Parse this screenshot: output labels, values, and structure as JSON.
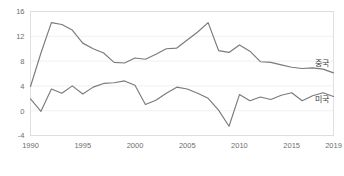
{
  "chart_data": {
    "type": "line",
    "title": "",
    "subtitle": "",
    "xlabel": "",
    "ylabel": "",
    "xlim": [
      1990,
      2019
    ],
    "ylim": [
      -4,
      16
    ],
    "yticks": [
      16,
      12,
      8,
      4,
      0,
      -4
    ],
    "ytick_labels": [
      "16",
      "12",
      "8",
      "4",
      "0",
      "-4"
    ],
    "xticks": [
      1990,
      1995,
      2000,
      2005,
      2010,
      2015,
      2019
    ],
    "xtick_labels": [
      "1990",
      "1995",
      "2000",
      "2005",
      "2010",
      "2015",
      "2019"
    ],
    "grid": true,
    "grid_axis": "y",
    "legend_position": "inline-right",
    "x": [
      1990,
      1991,
      1992,
      1993,
      1994,
      1995,
      1996,
      1997,
      1998,
      1999,
      2000,
      2001,
      2002,
      2003,
      2004,
      2005,
      2006,
      2007,
      2008,
      2009,
      2010,
      2011,
      2012,
      2013,
      2014,
      2015,
      2016,
      2017,
      2018,
      2019
    ],
    "series": [
      {
        "name": "중국",
        "label": "중국",
        "color": "#7a7a7a",
        "label_x": 2019,
        "label_y": 7.2,
        "values": [
          3.9,
          9.3,
          14.2,
          13.9,
          13.0,
          10.9,
          10.0,
          9.3,
          7.8,
          7.7,
          8.5,
          8.3,
          9.1,
          10.0,
          10.1,
          11.4,
          12.7,
          14.2,
          9.7,
          9.4,
          10.6,
          9.6,
          7.9,
          7.8,
          7.4,
          7.0,
          6.8,
          6.9,
          6.7,
          6.1
        ]
      },
      {
        "name": "미국",
        "label": "미국",
        "color": "#7a7a7a",
        "label_x": 2019,
        "label_y": 1.4,
        "values": [
          1.9,
          -0.1,
          3.5,
          2.8,
          4.0,
          2.7,
          3.8,
          4.4,
          4.5,
          4.8,
          4.1,
          1.0,
          1.7,
          2.8,
          3.8,
          3.5,
          2.8,
          2.0,
          0.1,
          -2.5,
          2.6,
          1.6,
          2.2,
          1.8,
          2.5,
          2.9,
          1.6,
          2.4,
          2.9,
          2.3
        ]
      }
    ]
  }
}
